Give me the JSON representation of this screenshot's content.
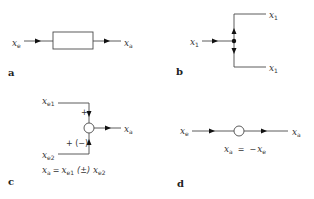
{
  "panels": {
    "a": {
      "label": "a",
      "input": {
        "var": "x",
        "sub": "e"
      },
      "output": {
        "var": "x",
        "sub": "a"
      },
      "element": "transfer-block"
    },
    "b": {
      "label": "b",
      "input": {
        "var": "x",
        "sub": "1"
      },
      "output_top": {
        "var": "x",
        "sub": "1"
      },
      "output_bottom": {
        "var": "x",
        "sub": "1"
      },
      "element": "branch-point"
    },
    "c": {
      "label": "c",
      "input1": {
        "var": "x",
        "sub": "e1"
      },
      "input2": {
        "var": "x",
        "sub": "e2"
      },
      "output": {
        "var": "x",
        "sub": "a"
      },
      "sign1": "+",
      "sign2": "+ (−)",
      "equation": {
        "lhs_var": "x",
        "lhs_sub": "a",
        "eq": "=",
        "t1_var": "x",
        "t1_sub": "e1",
        "op": "(±)",
        "t2_var": "x",
        "t2_sub": "e2"
      },
      "element": "summing-junction"
    },
    "d": {
      "label": "d",
      "input": {
        "var": "x",
        "sub": "e"
      },
      "output": {
        "var": "x",
        "sub": "a"
      },
      "equation": {
        "lhs_var": "x",
        "lhs_sub": "a",
        "eq": "=",
        "neg": "−",
        "rhs_var": "x",
        "rhs_sub": "e"
      },
      "element": "inverting-junction"
    }
  },
  "colors": {
    "line": "#4a4a4a",
    "arrow": "#111111",
    "text": "#333333"
  }
}
